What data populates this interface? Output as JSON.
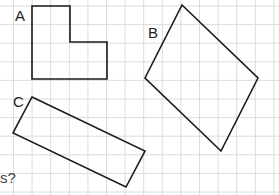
{
  "grid": {
    "spacing": 18.6,
    "origin_x": 13.5,
    "origin_y": 6,
    "color": "#dcdcdc"
  },
  "shapes": [
    {
      "label": "A",
      "label_pos": [
        15,
        21
      ],
      "points": [
        [
          32,
          6
        ],
        [
          70,
          6
        ],
        [
          70,
          42
        ],
        [
          107,
          42
        ],
        [
          107,
          79
        ],
        [
          32,
          79
        ]
      ]
    },
    {
      "label": "B",
      "label_pos": [
        148,
        38
      ],
      "points": [
        [
          182,
          5
        ],
        [
          258,
          78
        ],
        [
          221,
          151
        ],
        [
          145,
          78
        ]
      ]
    },
    {
      "label": "C",
      "label_pos": [
        13,
        107
      ],
      "points": [
        [
          32,
          97
        ],
        [
          145,
          151
        ],
        [
          126,
          187
        ],
        [
          13,
          133
        ]
      ]
    }
  ],
  "note_text": "s?"
}
